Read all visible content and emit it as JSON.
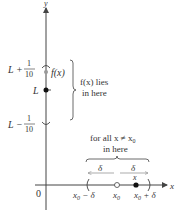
{
  "axes": {
    "x_label": "x",
    "y_label": "y",
    "origin_label": "0"
  },
  "y_marks": {
    "upper": {
      "prefix": "L +",
      "num": "1",
      "den": "10"
    },
    "middle": "L",
    "lower": {
      "prefix": "L −",
      "num": "1",
      "den": "10"
    },
    "point_label": "f(x)"
  },
  "annotations": {
    "fx_range_line1": "f(x) lies",
    "fx_range_line2": "in here",
    "x_range_line1": "for all x ≠ x",
    "x_range_sub": "0",
    "x_range_line2": "in here",
    "delta_left": "δ",
    "delta_right": "δ"
  },
  "x_marks": {
    "left": {
      "base": "x",
      "sub": "0",
      "suffix": " − δ"
    },
    "center": {
      "base": "x",
      "sub": "0"
    },
    "point": "x",
    "right": {
      "base": "x",
      "sub": "0",
      "suffix": " + δ"
    }
  },
  "colors": {
    "axis": "#444444",
    "ink": "#333333",
    "open_point": "#ffffff",
    "filled_point": "#111111",
    "gray_point": "#999999"
  }
}
